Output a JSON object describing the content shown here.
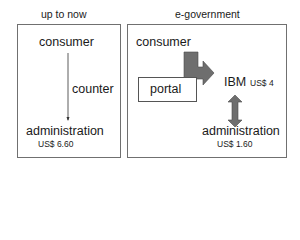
{
  "left_panel": {
    "title": "up to now",
    "consumer": "consumer",
    "channel": "counter",
    "administration": "administration",
    "cost": "US$ 6.60"
  },
  "right_panel": {
    "title": "e-government",
    "consumer": "consumer",
    "portal": "portal",
    "provider": "IBM",
    "provider_cost": "US$ 4",
    "administration": "administration",
    "cost": "US$ 1.60"
  },
  "colors": {
    "border": "#707070",
    "arrow_fill": "#6e6e6e",
    "arrow_stroke": "#4a4a4a",
    "text": "#1a1a1a"
  }
}
